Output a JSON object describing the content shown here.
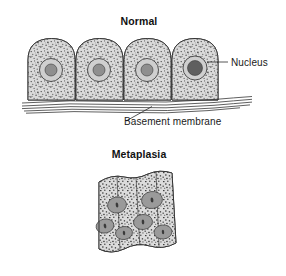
{
  "figure": {
    "type": "biological-diagram",
    "background_color": "#ffffff",
    "width": 286,
    "height": 276
  },
  "panels": [
    {
      "id": "normal",
      "title": "Normal",
      "title_x": 139,
      "title_y": 25
    },
    {
      "id": "metaplasia",
      "title": "Metaplasia",
      "title_x": 139,
      "title_y": 158
    }
  ],
  "labels": [
    {
      "id": "nucleus",
      "text": "Nucleus",
      "x": 231,
      "y": 64
    },
    {
      "id": "basement-membrane",
      "text": "Basement membrane",
      "x": 129,
      "y": 125
    }
  ],
  "colors": {
    "cytoplasm": "#d8d8d8",
    "stipple": "#4a4a4a",
    "outline": "#2e2e2e",
    "nucleus_halo": "#cfcfcf",
    "nucleus_core_light": "#8f8f8f",
    "nucleus_core_dark": "#5f5f5f",
    "metaplasia_nucleus": "#9a9a9a",
    "text": "#1a1a1a"
  },
  "normal_epithelium": {
    "description": "Four tall columnar cells with domed apical surfaces resting on a basement membrane",
    "cell_count": 4,
    "row_left": 28,
    "row_right": 218,
    "top_y": 38,
    "bottom_y": 100,
    "cells": [
      {
        "index": 1,
        "x": 28,
        "width": 47,
        "nucleus_cx": 51,
        "nucleus_cy": 70,
        "nucleus_r": 11.5,
        "core_r": 6.0,
        "core_fill": "#8f8f8f"
      },
      {
        "index": 2,
        "x": 76,
        "width": 47,
        "nucleus_cx": 99,
        "nucleus_cy": 70,
        "nucleus_r": 11.5,
        "core_r": 6.0,
        "core_fill": "#8f8f8f"
      },
      {
        "index": 3,
        "x": 124,
        "width": 47,
        "nucleus_cx": 147,
        "nucleus_cy": 70,
        "nucleus_r": 11.5,
        "core_r": 6.0,
        "core_fill": "#8f8f8f"
      },
      {
        "index": 4,
        "x": 172,
        "width": 46,
        "nucleus_cx": 195,
        "nucleus_cy": 68,
        "nucleus_r": 12.0,
        "core_r": 7.5,
        "core_fill": "#5f5f5f"
      }
    ]
  },
  "basement_membrane": {
    "description": "Set of wavy parallel fibre lines beneath the columnar cells, extending to the right of the cell row",
    "line_count": 5,
    "left_x": 22,
    "right_x": 252,
    "band_top_y": 98,
    "band_bottom_y": 112
  },
  "metaplasia_epithelium": {
    "description": "Tilted slab of flattened squamous cells with angular grey nuclei replacing the columnar layer",
    "left_x": 92,
    "right_x": 176,
    "top_y": 172,
    "bottom_y": 251,
    "column_count": 4,
    "nuclei": [
      {
        "cx": 105,
        "cy": 226,
        "rx": 9.0,
        "ry": 7.0,
        "rot": -12
      },
      {
        "cx": 124,
        "cy": 233,
        "rx": 8.5,
        "ry": 6.5,
        "rot": -8
      },
      {
        "cx": 117,
        "cy": 205,
        "rx": 9.5,
        "ry": 8.0,
        "rot": -10
      },
      {
        "cx": 143,
        "cy": 222,
        "rx": 9.5,
        "ry": 7.5,
        "rot": -6
      },
      {
        "cx": 152,
        "cy": 200,
        "rx": 10.5,
        "ry": 8.5,
        "rot": -8
      },
      {
        "cx": 163,
        "cy": 232,
        "rx": 9.0,
        "ry": 7.0,
        "rot": -5
      }
    ]
  }
}
